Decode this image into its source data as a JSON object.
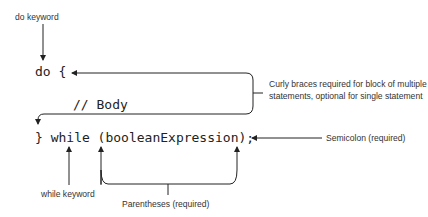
{
  "code": {
    "line1": "do {",
    "line2": "// Body",
    "line3": "} while (booleanExpression);"
  },
  "annotations": {
    "do_keyword": "do keyword",
    "curly_braces": "Curly braces required for block of multiple statements, optional for single statement",
    "semicolon": "Semicolon (required)",
    "while_keyword": "while keyword",
    "parentheses": "Parentheses (required)"
  }
}
